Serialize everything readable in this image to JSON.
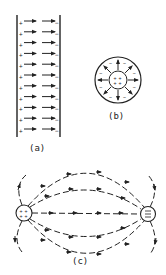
{
  "figure": {
    "panels": [
      {
        "id": "a",
        "label": "(a)",
        "description": "Parallel plates: positive plate (left) and negative plate (right) with uniform field arrows pointing right",
        "positive_sign": "+",
        "negative_sign": "−",
        "rows": 11
      },
      {
        "id": "b",
        "label": "(b)",
        "description": "Concentric spheres: positive inner sphere with radial field arrows outward to negative outer shell"
      },
      {
        "id": "c",
        "label": "(c)",
        "description": "Dipole field: positive charge (left) and negative charge (right) with curved dashed field lines"
      }
    ],
    "colors": {
      "ink": "#222222",
      "background": "#ffffff"
    }
  }
}
